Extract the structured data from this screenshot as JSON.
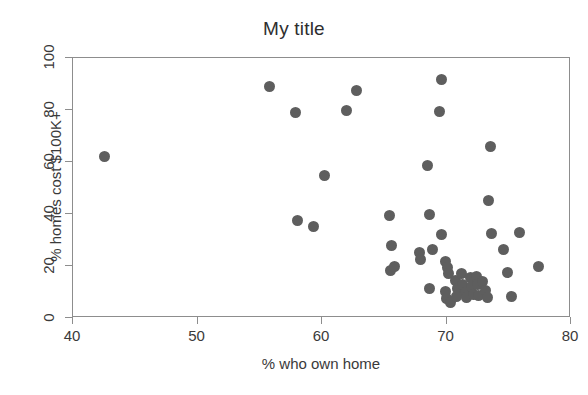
{
  "chart_data": {
    "type": "scatter",
    "title": "My title",
    "xlabel": "% who own home",
    "ylabel": "% homes cost $100K+",
    "xlim": [
      40,
      80
    ],
    "ylim": [
      0,
      100
    ],
    "xticks": [
      40,
      50,
      60,
      70,
      80
    ],
    "yticks": [
      0,
      20,
      40,
      60,
      80,
      100
    ],
    "grid": false,
    "legend": null,
    "marker": {
      "shape": "circle",
      "color": "#5e5e5e",
      "size_px": 11
    },
    "points": [
      {
        "x": 42.5,
        "y": 62.0
      },
      {
        "x": 55.8,
        "y": 89.0
      },
      {
        "x": 57.9,
        "y": 79.0
      },
      {
        "x": 58.0,
        "y": 37.5
      },
      {
        "x": 59.3,
        "y": 35.3
      },
      {
        "x": 60.2,
        "y": 54.7
      },
      {
        "x": 62.0,
        "y": 80.0
      },
      {
        "x": 62.8,
        "y": 87.5
      },
      {
        "x": 65.4,
        "y": 39.4
      },
      {
        "x": 65.6,
        "y": 28.0
      },
      {
        "x": 65.5,
        "y": 18.2
      },
      {
        "x": 65.8,
        "y": 19.8
      },
      {
        "x": 67.8,
        "y": 25.3
      },
      {
        "x": 67.9,
        "y": 22.4
      },
      {
        "x": 68.6,
        "y": 39.8
      },
      {
        "x": 68.5,
        "y": 58.6
      },
      {
        "x": 68.9,
        "y": 26.4
      },
      {
        "x": 68.6,
        "y": 11.3
      },
      {
        "x": 69.6,
        "y": 91.6
      },
      {
        "x": 69.4,
        "y": 79.6
      },
      {
        "x": 69.6,
        "y": 32.0
      },
      {
        "x": 69.9,
        "y": 21.6
      },
      {
        "x": 70.1,
        "y": 19.6
      },
      {
        "x": 70.2,
        "y": 17.2
      },
      {
        "x": 69.9,
        "y": 10.3
      },
      {
        "x": 70.0,
        "y": 7.6
      },
      {
        "x": 70.3,
        "y": 5.8
      },
      {
        "x": 70.7,
        "y": 14.6
      },
      {
        "x": 70.9,
        "y": 11.4
      },
      {
        "x": 70.8,
        "y": 8.4
      },
      {
        "x": 71.2,
        "y": 17.0
      },
      {
        "x": 71.3,
        "y": 13.0
      },
      {
        "x": 71.5,
        "y": 9.7
      },
      {
        "x": 71.6,
        "y": 7.8
      },
      {
        "x": 71.9,
        "y": 15.6
      },
      {
        "x": 72.0,
        "y": 12.2
      },
      {
        "x": 72.2,
        "y": 9.2
      },
      {
        "x": 72.4,
        "y": 16.0
      },
      {
        "x": 72.5,
        "y": 12.8
      },
      {
        "x": 72.6,
        "y": 8.6
      },
      {
        "x": 72.9,
        "y": 14.2
      },
      {
        "x": 73.1,
        "y": 10.4
      },
      {
        "x": 73.3,
        "y": 8.0
      },
      {
        "x": 73.4,
        "y": 45.2
      },
      {
        "x": 73.5,
        "y": 66.0
      },
      {
        "x": 73.6,
        "y": 32.6
      },
      {
        "x": 74.6,
        "y": 26.3
      },
      {
        "x": 74.9,
        "y": 17.4
      },
      {
        "x": 75.2,
        "y": 8.2
      },
      {
        "x": 75.9,
        "y": 32.7
      },
      {
        "x": 77.4,
        "y": 20.0
      }
    ]
  },
  "axes": {
    "x_tick_labels": [
      "40",
      "50",
      "60",
      "70",
      "80"
    ],
    "y_tick_labels": [
      "0",
      "20",
      "40",
      "60",
      "80",
      "100"
    ]
  }
}
